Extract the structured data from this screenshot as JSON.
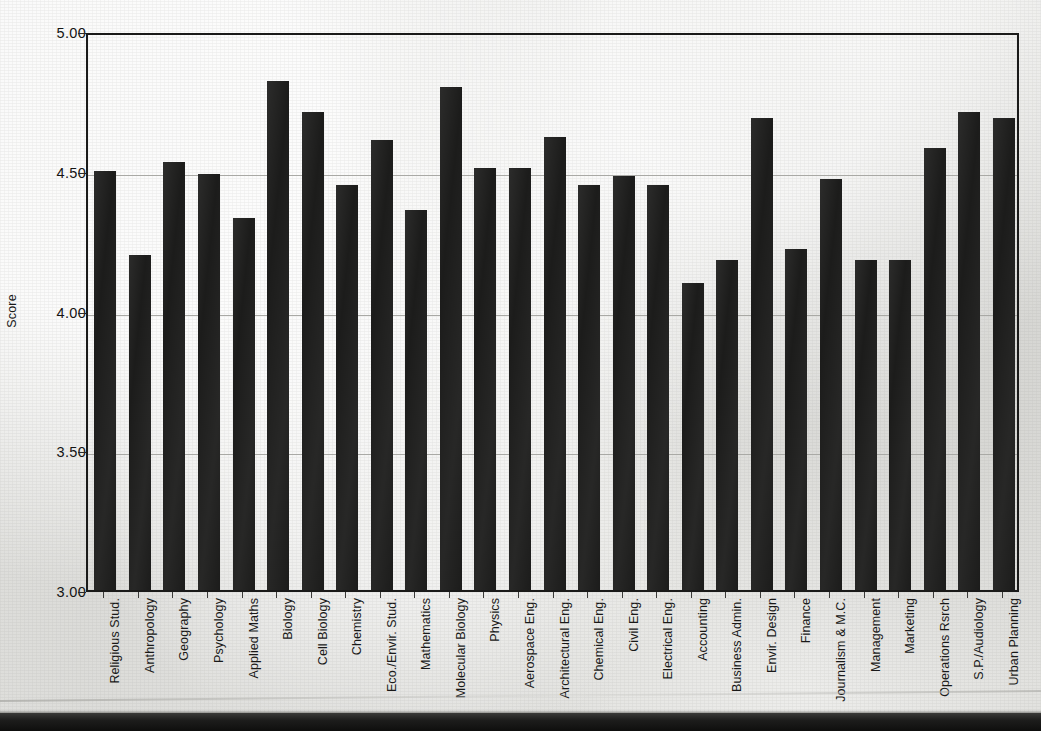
{
  "chart_data": {
    "type": "bar",
    "title": "",
    "subtitle": "",
    "xlabel": "",
    "ylabel": "Score",
    "ylim": [
      3.0,
      5.0
    ],
    "ytick_labels": [
      "5.00",
      "4.50",
      "4.00",
      "3.50",
      "3.00"
    ],
    "yticks": [
      5.0,
      4.5,
      4.0,
      3.5,
      3.0
    ],
    "grid": true,
    "legend": false,
    "legend_position": "none",
    "bar_color": "#1c1c1b",
    "background_color": "#e9e9e7",
    "axis_color": "#1a1a19",
    "gridline_color": "#a9a9a5",
    "categories": [
      "Religious Stud.",
      "Anthropology",
      "Geography",
      "Psychology",
      "Applied Maths",
      "Biology",
      "Cell Biology",
      "Chemistry",
      "Eco./Envir. Stud.",
      "Mathematics",
      "Molecular Biology",
      "Physics",
      "Aerospace Eng.",
      "Architectural Eng.",
      "Chemical Eng.",
      "Civil Eng.",
      "Electrical Eng.",
      "Accounting",
      "Business Admin.",
      "Envir. Design",
      "Finance",
      "Journalism & M.C.",
      "Management",
      "Marketing",
      "Operations Rsrch",
      "S.P./Audiology",
      "Urban Planning"
    ],
    "values": [
      4.5,
      4.2,
      4.53,
      4.49,
      4.33,
      4.82,
      4.71,
      4.45,
      4.61,
      4.36,
      4.8,
      4.51,
      4.51,
      4.62,
      4.45,
      4.48,
      4.45,
      4.1,
      4.18,
      4.69,
      4.22,
      4.47,
      4.18,
      4.18,
      4.58,
      4.71,
      4.69
    ]
  }
}
